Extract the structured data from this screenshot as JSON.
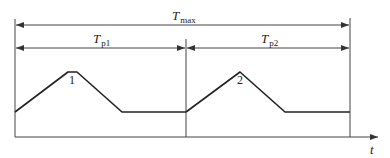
{
  "diagram": {
    "labels": {
      "t_max": {
        "symbol": "T",
        "subscript": "max"
      },
      "t_p1": {
        "symbol": "T",
        "subscript": "p1"
      },
      "t_p2": {
        "symbol": "T",
        "subscript": "p2"
      },
      "time_axis": "t",
      "peak_1": "1",
      "peak_2": "2"
    },
    "colors": {
      "line": "#333333",
      "background": "#ffffff"
    },
    "waveform_points": {
      "cycle_1": [
        [
          15,
          112
        ],
        [
          68,
          72
        ],
        [
          77,
          72
        ],
        [
          122,
          112
        ],
        [
          186,
          112
        ]
      ],
      "cycle_2": [
        [
          186,
          112
        ],
        [
          240,
          72
        ],
        [
          285,
          112
        ],
        [
          350,
          112
        ]
      ]
    }
  }
}
